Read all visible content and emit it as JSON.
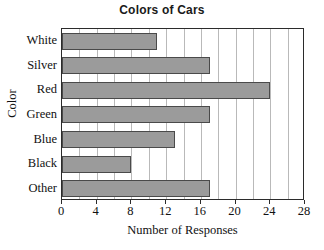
{
  "chart_data": {
    "type": "bar",
    "orientation": "horizontal",
    "title": "Colors of Cars",
    "xlabel": "Number of Responses",
    "ylabel": "Color",
    "categories": [
      "White",
      "Silver",
      "Red",
      "Green",
      "Blue",
      "Black",
      "Other"
    ],
    "values": [
      11,
      17,
      24,
      17,
      13,
      8,
      17
    ],
    "xlim": [
      0,
      28
    ],
    "xticks": [
      0,
      4,
      8,
      12,
      16,
      20,
      24,
      28
    ],
    "xticklabels": [
      "0",
      "4",
      "8",
      "12",
      "16",
      "20",
      "24",
      "28"
    ],
    "gridline_interval": 2,
    "grid": true,
    "legend": null,
    "bar_color": "#9b9b9b",
    "bar_border_color": "#4a4a4a",
    "grid_color": "#b9b9b9",
    "axis_color": "#2b2b2b",
    "background": "#ffffff"
  }
}
